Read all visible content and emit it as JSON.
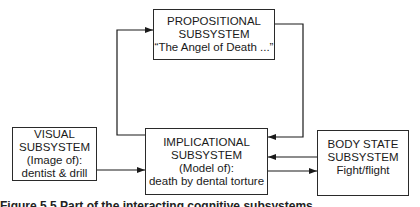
{
  "diagram": {
    "propositional": {
      "line1": "PROPOSITIONAL",
      "line2": "SUBSYSTEM",
      "line3": "“The Angel of Death ...”"
    },
    "visual": {
      "line1": "VISUAL",
      "line2": "SUBSYSTEM",
      "line3": "(Image of):",
      "line4": "dentist & drill"
    },
    "implicational": {
      "line1": "IMPLICATIONAL",
      "line2": "SUBSYSTEM",
      "line3": "(Model of):",
      "line4": "death by dental torture"
    },
    "body_state": {
      "line1": "BODY STATE",
      "line2": "SUBSYSTEM",
      "line3": "Fight/flight"
    },
    "connections": [
      {
        "from": "implicational",
        "to": "propositional"
      },
      {
        "from": "propositional",
        "to": "implicational"
      },
      {
        "from": "visual",
        "to": "implicational"
      },
      {
        "from": "body_state",
        "to": "implicational"
      },
      {
        "from": "implicational",
        "to": "body_state"
      }
    ],
    "caption_truncated": "Figure 5.5 Part of the interacting cognitive subsystems"
  }
}
